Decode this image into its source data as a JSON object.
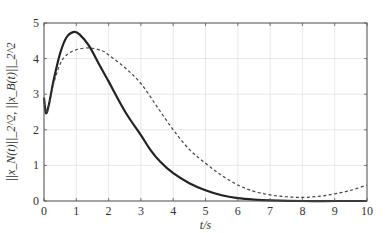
{
  "chart_data": {
    "type": "line",
    "title": "",
    "xlabel": "t/s",
    "ylabel": "||x_N(t)||_2^2, ||x_B(t)||_2^2",
    "xlim": [
      0,
      10
    ],
    "ylim": [
      0,
      5
    ],
    "xticks": [
      0,
      1,
      2,
      3,
      4,
      5,
      6,
      7,
      8,
      9,
      10
    ],
    "yticks": [
      0,
      1,
      2,
      3,
      4,
      5
    ],
    "grid": true,
    "legend": null,
    "series": [
      {
        "name": "||x_N(t)||_2^2",
        "style": "solid",
        "color": "#222222",
        "x": [
          0,
          0.06,
          0.15,
          0.3,
          0.5,
          0.7,
          0.93,
          1.1,
          1.4,
          1.7,
          2.0,
          2.3,
          2.6,
          3.0,
          3.3,
          3.6,
          4.0,
          4.5,
          5.0,
          5.5,
          6.0,
          6.5,
          7.0,
          8.0,
          9.0,
          10.0
        ],
        "y": [
          2.9,
          2.47,
          2.7,
          3.4,
          4.15,
          4.6,
          4.75,
          4.68,
          4.35,
          3.85,
          3.36,
          2.85,
          2.38,
          1.85,
          1.43,
          1.1,
          0.78,
          0.5,
          0.3,
          0.16,
          0.08,
          0.04,
          0.02,
          0.0,
          0.0,
          0.0
        ]
      },
      {
        "name": "||x_B(t)||_2^2",
        "style": "dashed",
        "color": "#444444",
        "x": [
          0,
          0.06,
          0.15,
          0.3,
          0.5,
          0.7,
          1.0,
          1.42,
          1.8,
          2.0,
          2.5,
          3.0,
          3.5,
          4.0,
          4.5,
          5.0,
          5.5,
          6.0,
          6.5,
          7.0,
          7.5,
          8.0,
          8.5,
          9.0,
          9.5,
          10.0
        ],
        "y": [
          2.9,
          2.47,
          2.7,
          3.3,
          3.85,
          4.1,
          4.25,
          4.3,
          4.22,
          4.1,
          3.75,
          3.3,
          2.65,
          2.0,
          1.45,
          1.06,
          0.72,
          0.45,
          0.27,
          0.17,
          0.12,
          0.1,
          0.13,
          0.2,
          0.3,
          0.45
        ]
      }
    ]
  }
}
